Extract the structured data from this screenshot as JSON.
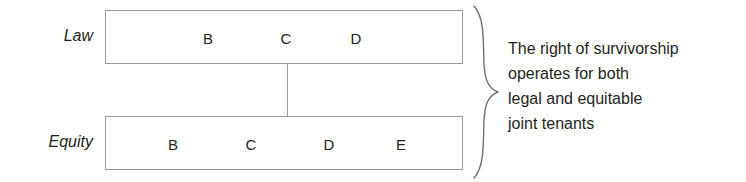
{
  "diagram": {
    "rows": [
      {
        "label": "Law",
        "tenants": [
          "B",
          "C",
          "D"
        ]
      },
      {
        "label": "Equity",
        "tenants": [
          "B",
          "C",
          "D",
          "E"
        ]
      }
    ],
    "connector": {
      "name": "vertical-connector"
    },
    "brace": {
      "name": "right-curly-brace"
    },
    "annotation": {
      "lines": [
        "The right of survivorship",
        "operates for both",
        "legal and equitable",
        "joint tenants"
      ]
    },
    "colors": {
      "text": "#231f20",
      "box_border": "#9a9a9a",
      "background": "#ffffff"
    }
  }
}
